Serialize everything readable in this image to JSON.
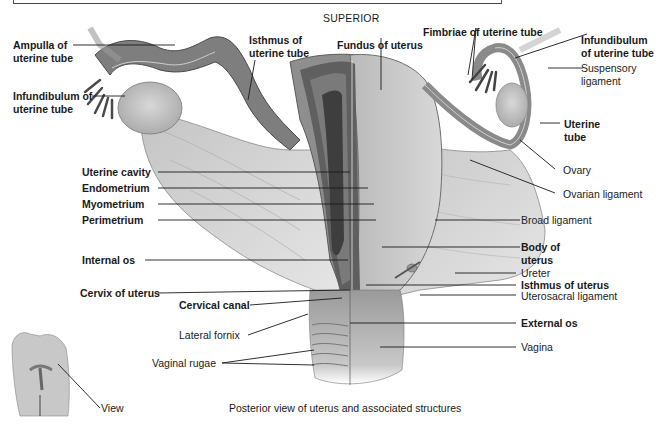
{
  "figure": {
    "orientation_label": "SUPERIOR",
    "caption": "Posterior view of uterus and associated structures",
    "inset_label": "View"
  },
  "labels_left": [
    {
      "id": "ampulla",
      "line1": "Ampulla of",
      "line2": "uterine tube",
      "bold": true
    },
    {
      "id": "infundibulum-left",
      "line1": "Infundibulum of",
      "line2": "uterine tube",
      "bold": true
    },
    {
      "id": "isthmus-tube",
      "line1": "Isthmus of",
      "line2": "uterine tube",
      "bold": true
    },
    {
      "id": "uterine-cavity",
      "text": "Uterine cavity",
      "bold": true
    },
    {
      "id": "endometrium",
      "text": "Endometrium",
      "bold": true
    },
    {
      "id": "myometrium",
      "text": "Myometrium",
      "bold": true
    },
    {
      "id": "perimetrium",
      "text": "Perimetrium",
      "bold": true
    },
    {
      "id": "internal-os",
      "text": "Internal os",
      "bold": true
    },
    {
      "id": "cervix",
      "text": "Cervix of uterus",
      "bold": true
    },
    {
      "id": "cervical-canal",
      "text": "Cervical canal",
      "bold": true
    },
    {
      "id": "lateral-fornix",
      "text": "Lateral fornix",
      "bold": false
    },
    {
      "id": "vaginal-rugae",
      "text": "Vaginal rugae",
      "bold": false
    }
  ],
  "labels_right": [
    {
      "id": "fundus",
      "text": "Fundus of uterus",
      "bold": true
    },
    {
      "id": "fimbriae",
      "text": "Fimbriae of uterine tube",
      "bold": true
    },
    {
      "id": "infundibulum-right",
      "line1": "Infundibulum",
      "line2": "of uterine tube",
      "bold": true
    },
    {
      "id": "suspensory",
      "line1": "Suspensory",
      "line2": "ligament",
      "bold": false
    },
    {
      "id": "uterine-tube",
      "line1": "Uterine",
      "line2": "tube",
      "bold": true
    },
    {
      "id": "ovary",
      "text": "Ovary",
      "bold": false
    },
    {
      "id": "ovarian-ligament",
      "text": "Ovarian ligament",
      "bold": false
    },
    {
      "id": "broad-ligament",
      "text": "Broad ligament",
      "bold": false
    },
    {
      "id": "body-of-uterus",
      "line1": "Body of",
      "line2": "uterus",
      "bold": true
    },
    {
      "id": "ureter",
      "text": "Ureter",
      "bold": false
    },
    {
      "id": "isthmus-uterus",
      "text": "Isthmus of uterus",
      "bold": true
    },
    {
      "id": "uterosacral",
      "text": "Uterosacral ligament",
      "bold": false
    },
    {
      "id": "external-os",
      "text": "External os",
      "bold": true
    },
    {
      "id": "vagina",
      "text": "Vagina",
      "bold": false
    }
  ],
  "colors": {
    "tissue_light": "#d4d4d4",
    "tissue_mid": "#a8a8a8",
    "tissue_dark": "#6e6e6e",
    "tissue_darkest": "#3e3e3e",
    "leader": "#1a1a1a"
  }
}
